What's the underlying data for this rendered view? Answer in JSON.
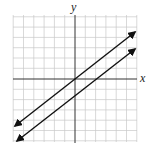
{
  "diagram": {
    "type": "coordinate-plane",
    "axis_labels": {
      "x": "x",
      "y": "y"
    },
    "grid": {
      "columns": 12,
      "rows": 12,
      "cell_px": 10.3
    },
    "lines": [
      {
        "name": "line-through-origin",
        "slope": 1,
        "y_intercept": 0
      },
      {
        "name": "line-shifted-down",
        "slope": 1,
        "y_intercept": -2
      }
    ],
    "colors": {
      "grid": "#c8c8c8",
      "axis": "#333333",
      "line": "#111111"
    }
  }
}
